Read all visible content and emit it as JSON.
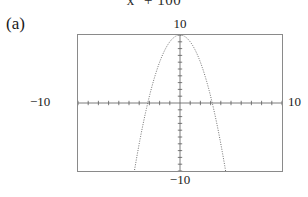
{
  "figure": {
    "part_label": "(a)",
    "equation_fragment_prefix": "x",
    "equation_fragment_exponent": "2",
    "equation_fragment_suffix": " + 100"
  },
  "labels": {
    "y_max": "10",
    "y_min": "−10",
    "x_min": "−10",
    "x_max": "10"
  },
  "chart_data": {
    "type": "line",
    "title": "",
    "subtitle": "",
    "xlabel": "",
    "ylabel": "",
    "xlim": [
      -10,
      10
    ],
    "ylim": [
      -10,
      10
    ],
    "grid": false,
    "legend": null,
    "style": "dotted-calculator-trace",
    "axes": {
      "x_axis_at_y": 0,
      "y_axis_at_x": 0,
      "tick_spacing_x": 1,
      "tick_spacing_y": 1,
      "tick_marks": true,
      "tick_labels": false
    },
    "annotations": [
      {
        "text": "10",
        "position": "above-window-center",
        "meaning": "y-maximum of viewing window"
      },
      {
        "text": "−10",
        "position": "below-window-center",
        "meaning": "y-minimum of viewing window"
      },
      {
        "text": "−10",
        "position": "left-of-window",
        "meaning": "x-minimum of viewing window"
      },
      {
        "text": "10",
        "position": "right-of-window",
        "meaning": "x-maximum of viewing window"
      }
    ],
    "series": [
      {
        "name": "y = -x^2 + 10",
        "vertex": [
          0,
          10
        ],
        "roots": [
          -3.16,
          3.16
        ],
        "opens": "down",
        "x": [
          -4.2,
          -4.0,
          -3.8,
          -3.6,
          -3.4,
          -3.2,
          -3.0,
          -2.8,
          -2.6,
          -2.4,
          -2.2,
          -2.0,
          -1.8,
          -1.6,
          -1.4,
          -1.2,
          -1.0,
          -0.8,
          -0.6,
          -0.4,
          -0.2,
          0.0,
          0.2,
          0.4,
          0.6,
          0.8,
          1.0,
          1.2,
          1.4,
          1.6,
          1.8,
          2.0,
          2.2,
          2.4,
          2.6,
          2.8,
          3.0,
          3.2,
          3.4,
          3.6,
          3.8,
          4.0,
          4.2
        ],
        "values": [
          -7.64,
          -6.0,
          -4.44,
          -2.96,
          -1.56,
          -0.24,
          1.0,
          2.16,
          3.24,
          4.24,
          5.16,
          6.0,
          6.76,
          7.44,
          8.04,
          8.56,
          9.0,
          9.36,
          9.64,
          9.84,
          9.96,
          10.0,
          9.96,
          9.84,
          9.64,
          9.36,
          9.0,
          8.56,
          8.04,
          7.44,
          6.76,
          6.0,
          5.16,
          4.24,
          3.24,
          2.16,
          1.0,
          -0.24,
          -1.56,
          -2.96,
          -4.44,
          -6.0,
          -7.64
        ]
      }
    ]
  },
  "colors": {
    "window_border": "#8a8a8a",
    "axis": "#5a5a5a",
    "curve": "#6e6e6e",
    "text": "#1a1a1a",
    "background": "#ffffff"
  }
}
